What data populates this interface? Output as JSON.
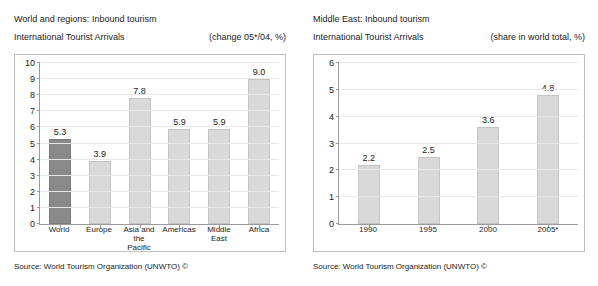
{
  "panels": [
    {
      "id": "world-and-regions",
      "title": "World and regions: Inbound tourism",
      "subtitle": "International Tourist Arrivals",
      "note": "(change 05*/04, %)",
      "source": "Source: World Tourism Organization (UNWTO) ©"
    },
    {
      "id": "middle-east",
      "title": "Middle East: Inbound tourism",
      "subtitle": "International Tourist Arrivals",
      "note": "(share in world total, %)",
      "source": "Source: World Tourism Organization (UNWTO) ©"
    }
  ],
  "chart_data": [
    {
      "type": "bar",
      "title": "World and regions: Inbound tourism — International Tourist Arrivals",
      "xlabel": "",
      "ylabel": "",
      "ylim": [
        0,
        10
      ],
      "yticks": [
        0,
        1,
        2,
        3,
        4,
        5,
        6,
        7,
        8,
        9,
        10
      ],
      "ytick_labels": [
        "0",
        "1",
        "2",
        "3",
        "4",
        "5",
        "6",
        "7",
        "8",
        "9",
        "10"
      ],
      "grid": true,
      "legend": "none",
      "value_labels": true,
      "unit": "(change 05*/04, %)",
      "categories": [
        "World",
        "Europe",
        "Asia and the Pacific",
        "Americas",
        "Middle East",
        "Africa"
      ],
      "category_lines": [
        [
          "World"
        ],
        [
          "Europe"
        ],
        [
          "Asia and the",
          "Pacific"
        ],
        [
          "Americas"
        ],
        [
          "Middle East"
        ],
        [
          "Africa"
        ]
      ],
      "values": [
        5.3,
        3.9,
        7.8,
        5.9,
        5.9,
        9.0
      ],
      "value_text": [
        "5.3",
        "3.9",
        "7.8",
        "5.9",
        "5.9",
        "9.0"
      ],
      "bar_colors": [
        "#8a8a8a",
        "#d9d9d9",
        "#d9d9d9",
        "#d9d9d9",
        "#d9d9d9",
        "#d9d9d9"
      ],
      "highlight_index": 0
    },
    {
      "type": "bar",
      "title": "Middle East: Inbound tourism — International Tourist Arrivals",
      "xlabel": "",
      "ylabel": "",
      "ylim": [
        0,
        6
      ],
      "yticks": [
        0,
        1,
        2,
        3,
        4,
        5,
        6
      ],
      "ytick_labels": [
        "0",
        "1",
        "2",
        "3",
        "4",
        "5",
        "6"
      ],
      "grid": true,
      "legend": "none",
      "value_labels": true,
      "unit": "(share in world total, %)",
      "categories": [
        "1990",
        "1995",
        "2000",
        "2005*"
      ],
      "category_lines": [
        [
          "1990"
        ],
        [
          "1995"
        ],
        [
          "2000"
        ],
        [
          "2005*"
        ]
      ],
      "values": [
        2.2,
        2.5,
        3.6,
        4.8
      ],
      "value_text": [
        "2.2",
        "2.5",
        "3.6",
        "4.8"
      ],
      "bar_colors": [
        "#d9d9d9",
        "#d9d9d9",
        "#d9d9d9",
        "#d9d9d9"
      ],
      "highlight_index": -1
    }
  ]
}
